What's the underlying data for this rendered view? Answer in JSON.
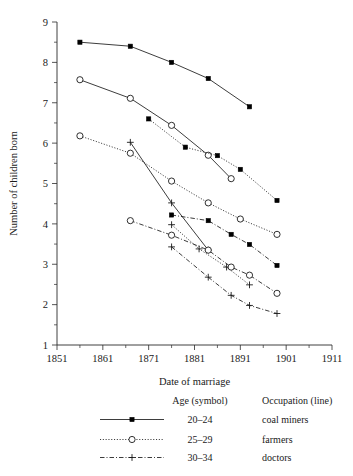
{
  "chart_data": {
    "type": "line",
    "title": "",
    "xlabel": "Date of marriage",
    "ylabel": "Number of children born",
    "xlim": [
      1851,
      1911
    ],
    "ylim": [
      1,
      9
    ],
    "xticks": [
      1851,
      1861,
      1871,
      1881,
      1891,
      1901,
      1911
    ],
    "yticks": [
      1,
      2,
      3,
      4,
      5,
      6,
      7,
      8,
      9
    ],
    "xtick_minor_step": 5,
    "ytick_minor_step": 0.5,
    "grid": false,
    "legend_position": "below-axes",
    "legend_headers": {
      "symbol": "Age (symbol)",
      "line": "Occupation (line)"
    },
    "symbol_legend": [
      {
        "age": "20–24",
        "marker": "filled-square"
      },
      {
        "age": "25–29",
        "marker": "open-circle"
      },
      {
        "age": "30–34",
        "marker": "plus"
      }
    ],
    "line_legend": [
      {
        "occupation": "coal miners",
        "linestyle": "solid"
      },
      {
        "occupation": "farmers",
        "linestyle": "dotted"
      },
      {
        "occupation": "doctors",
        "linestyle": "dash-dot"
      }
    ],
    "series": [
      {
        "name": "coal miners 20–24",
        "occupation": "coal miners",
        "age": "20–24",
        "linestyle": "solid",
        "marker": "filled-square",
        "x": [
          1856,
          1867,
          1876,
          1884,
          1893
        ],
        "values": [
          8.5,
          8.4,
          8.0,
          7.6,
          6.9
        ]
      },
      {
        "name": "coal miners 25–29",
        "occupation": "coal miners",
        "age": "25–29",
        "linestyle": "solid",
        "marker": "open-circle",
        "x": [
          1856,
          1867,
          1876,
          1884,
          1889
        ],
        "values": [
          7.57,
          7.11,
          6.44,
          5.7,
          5.12
        ]
      },
      {
        "name": "coal miners 30–34",
        "occupation": "coal miners",
        "age": "30–34",
        "linestyle": "solid",
        "marker": "plus",
        "x": [
          1867,
          1876,
          1884
        ],
        "values": [
          6.02,
          4.52,
          3.35
        ]
      },
      {
        "name": "farmers 20–24",
        "occupation": "farmers",
        "age": "20–24",
        "linestyle": "dotted",
        "marker": "filled-square",
        "x": [
          1871,
          1879,
          1886,
          1891,
          1899
        ],
        "values": [
          6.6,
          5.9,
          5.69,
          5.35,
          4.58
        ]
      },
      {
        "name": "farmers 25–29",
        "occupation": "farmers",
        "age": "25–29",
        "linestyle": "dotted",
        "marker": "open-circle",
        "x": [
          1856,
          1867,
          1876,
          1884,
          1891,
          1899
        ],
        "values": [
          6.18,
          5.75,
          5.06,
          4.52,
          4.12,
          3.74
        ]
      },
      {
        "name": "farmers 30–34",
        "occupation": "farmers",
        "age": "30–34",
        "linestyle": "dotted",
        "marker": "plus",
        "x": [
          1876,
          1882,
          1888,
          1893
        ],
        "values": [
          3.98,
          3.38,
          2.93,
          2.49
        ]
      },
      {
        "name": "doctors 20–24",
        "occupation": "doctors",
        "age": "20–24",
        "linestyle": "dash-dot",
        "marker": "filled-square",
        "x": [
          1876,
          1884,
          1889,
          1893,
          1899
        ],
        "values": [
          4.22,
          4.08,
          3.74,
          3.49,
          2.97
        ]
      },
      {
        "name": "doctors 25–29",
        "occupation": "doctors",
        "age": "25–29",
        "linestyle": "dash-dot",
        "marker": "open-circle",
        "x": [
          1867,
          1876,
          1884,
          1889,
          1893,
          1899
        ],
        "values": [
          4.08,
          3.72,
          3.35,
          2.93,
          2.73,
          2.28
        ]
      },
      {
        "name": "doctors 30–34",
        "occupation": "doctors",
        "age": "30–34",
        "linestyle": "dash-dot",
        "marker": "plus",
        "x": [
          1876,
          1884,
          1889,
          1893,
          1899
        ],
        "values": [
          3.43,
          2.68,
          2.23,
          1.98,
          1.78
        ]
      }
    ]
  }
}
